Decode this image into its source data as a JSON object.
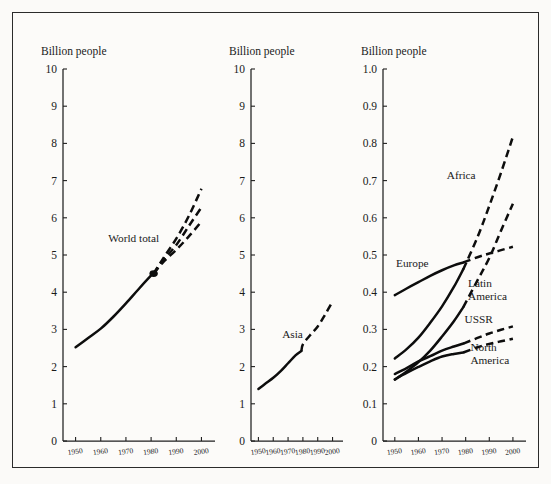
{
  "figure": {
    "background": "#fbfaf8",
    "frame_color": "#2b2b2b",
    "line_color": "#0d0d0d"
  },
  "chart_data": [
    {
      "type": "line",
      "title": "",
      "ylabel": "Billion people",
      "xlabel": "",
      "xlim": [
        1945,
        2003
      ],
      "ylim": [
        0,
        10
      ],
      "yticks": [
        0,
        1,
        2,
        3,
        4,
        5,
        6,
        7,
        8,
        9,
        10
      ],
      "ytick_labels": [
        "0",
        "1",
        "2",
        "3",
        "4",
        "5",
        "6",
        "7",
        "8",
        "9",
        "10"
      ],
      "xticks": [
        1950,
        1960,
        1970,
        1980,
        1990,
        2000
      ],
      "xtick_labels": [
        "1950",
        "1960",
        "1970",
        "1980",
        "1990",
        "2000"
      ],
      "grid": false,
      "legend": "inline-annotation",
      "annotations": [
        {
          "text": "World total",
          "x": 1963,
          "y": 5.35
        }
      ],
      "branch_node": {
        "x": 1981,
        "y": 4.5
      },
      "series": [
        {
          "name": "World total (observed)",
          "style": "solid",
          "x": [
            1950,
            1955,
            1960,
            1965,
            1970,
            1975,
            1980,
            1981
          ],
          "values": [
            2.52,
            2.77,
            3.02,
            3.34,
            3.7,
            4.08,
            4.45,
            4.5
          ]
        },
        {
          "name": "World total (high projection)",
          "style": "dashed",
          "x": [
            1981,
            1985,
            1990,
            1995,
            2000
          ],
          "values": [
            4.5,
            4.93,
            5.44,
            6.05,
            6.78
          ]
        },
        {
          "name": "World total (medium projection)",
          "style": "dashed",
          "x": [
            1981,
            1985,
            1990,
            1995,
            2000
          ],
          "values": [
            4.5,
            4.87,
            5.27,
            5.78,
            6.28
          ]
        },
        {
          "name": "World total (low projection)",
          "style": "dashed",
          "x": [
            1981,
            1985,
            1990,
            1995,
            2000
          ],
          "values": [
            4.5,
            4.82,
            5.14,
            5.5,
            5.9
          ]
        }
      ]
    },
    {
      "type": "line",
      "title": "",
      "ylabel": "Billion people",
      "xlabel": "",
      "xlim": [
        1945,
        2003
      ],
      "ylim": [
        0,
        10
      ],
      "yticks": [
        0,
        1,
        2,
        3,
        4,
        5,
        6,
        7,
        8,
        9,
        10
      ],
      "ytick_labels": [
        "0",
        "1",
        "2",
        "3",
        "4",
        "5",
        "6",
        "7",
        "8",
        "9",
        "10"
      ],
      "xticks": [
        1950,
        1960,
        1970,
        1980,
        1990,
        2000
      ],
      "xtick_labels": [
        "1950",
        "1960",
        "1970",
        "1980",
        "1990",
        "2000"
      ],
      "grid": false,
      "legend": "inline-annotation",
      "annotations": [
        {
          "text": "Asia",
          "x": 1966,
          "y": 2.78
        }
      ],
      "series": [
        {
          "name": "Asia (observed)",
          "style": "solid",
          "x": [
            1950,
            1955,
            1960,
            1965,
            1970,
            1975,
            1979
          ],
          "values": [
            1.4,
            1.55,
            1.7,
            1.88,
            2.09,
            2.3,
            2.42
          ]
        },
        {
          "name": "Asia (projection)",
          "style": "dashed",
          "x": [
            1979,
            1980,
            1985,
            1990,
            1995,
            2000
          ],
          "values": [
            2.42,
            2.6,
            2.85,
            3.08,
            3.4,
            3.75
          ]
        }
      ]
    },
    {
      "type": "line",
      "title": "",
      "ylabel": "Billion people",
      "xlabel": "",
      "xlim": [
        1945,
        2003
      ],
      "ylim": [
        0,
        1.0
      ],
      "yticks": [
        0,
        0.1,
        0.2,
        0.3,
        0.4,
        0.5,
        0.6,
        0.7,
        0.8,
        0.9,
        1.0
      ],
      "ytick_labels": [
        "0",
        "0.1",
        "0.2",
        "0.3",
        "0.4",
        "0.5",
        "0.6",
        "0.7",
        "0.8",
        "0.9",
        "1.0"
      ],
      "xticks": [
        1950,
        1960,
        1970,
        1980,
        1990,
        2000
      ],
      "xtick_labels": [
        "1950",
        "1960",
        "1970",
        "1980",
        "1990",
        "2000"
      ],
      "grid": false,
      "legend": "inline-annotation",
      "annotations": [
        {
          "text": "Africa",
          "x": 1972,
          "y": 0.705
        },
        {
          "text": "Europe",
          "x": 1950.5,
          "y": 0.468
        },
        {
          "text": "Latin",
          "x": 1981,
          "y": 0.415
        },
        {
          "text": "America",
          "x": 1981,
          "y": 0.378
        },
        {
          "text": "USSR",
          "x": 1979.5,
          "y": 0.318
        },
        {
          "text": "North",
          "x": 1982,
          "y": 0.243
        },
        {
          "text": "America",
          "x": 1982,
          "y": 0.206
        }
      ],
      "series": [
        {
          "name": "Africa (observed)",
          "style": "solid",
          "x": [
            1950,
            1955,
            1960,
            1965,
            1970,
            1975,
            1979
          ],
          "values": [
            0.222,
            0.247,
            0.278,
            0.318,
            0.362,
            0.414,
            0.462
          ]
        },
        {
          "name": "Africa (projection)",
          "style": "dashed",
          "x": [
            1979,
            1985,
            1990,
            1995,
            2000
          ],
          "values": [
            0.462,
            0.548,
            0.632,
            0.722,
            0.818
          ]
        },
        {
          "name": "Europe (observed)",
          "style": "solid",
          "x": [
            1950,
            1955,
            1960,
            1965,
            1970,
            1975,
            1979
          ],
          "values": [
            0.392,
            0.41,
            0.427,
            0.444,
            0.459,
            0.472,
            0.48
          ]
        },
        {
          "name": "Europe (projection)",
          "style": "dashed",
          "x": [
            1979,
            1985,
            1990,
            1995,
            2000
          ],
          "values": [
            0.48,
            0.494,
            0.504,
            0.513,
            0.522
          ]
        },
        {
          "name": "Latin America (observed)",
          "style": "solid",
          "x": [
            1950,
            1955,
            1960,
            1965,
            1970,
            1975,
            1979
          ],
          "values": [
            0.165,
            0.187,
            0.212,
            0.243,
            0.281,
            0.322,
            0.36
          ]
        },
        {
          "name": "Latin America (projection)",
          "style": "dashed",
          "x": [
            1979,
            1985,
            1990,
            1995,
            2000
          ],
          "values": [
            0.36,
            0.432,
            0.492,
            0.566,
            0.638
          ]
        },
        {
          "name": "USSR (observed)",
          "style": "solid",
          "x": [
            1950,
            1955,
            1960,
            1965,
            1970,
            1975,
            1979
          ],
          "values": [
            0.18,
            0.196,
            0.214,
            0.228,
            0.243,
            0.254,
            0.262
          ]
        },
        {
          "name": "USSR (projection)",
          "style": "dashed",
          "x": [
            1979,
            1985,
            1990,
            1995,
            2000
          ],
          "values": [
            0.262,
            0.277,
            0.289,
            0.299,
            0.308
          ]
        },
        {
          "name": "North America (observed)",
          "style": "solid",
          "x": [
            1950,
            1955,
            1960,
            1965,
            1970,
            1975,
            1979
          ],
          "values": [
            0.166,
            0.183,
            0.199,
            0.214,
            0.227,
            0.234,
            0.238
          ]
        },
        {
          "name": "North America (projection)",
          "style": "dashed",
          "x": [
            1979,
            1985,
            1990,
            1995,
            2000
          ],
          "values": [
            0.238,
            0.252,
            0.261,
            0.268,
            0.275
          ]
        }
      ]
    }
  ],
  "panels": [
    {
      "id": "world",
      "left": 18,
      "width": 196
    },
    {
      "id": "asia",
      "left": 214,
      "width": 120
    },
    {
      "id": "regions",
      "left": 334,
      "width": 206
    }
  ]
}
